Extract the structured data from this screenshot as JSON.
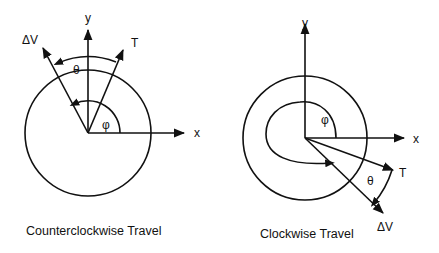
{
  "diagrams": [
    {
      "id": "counterclockwise",
      "caption": "Counterclockwise Travel",
      "axes": {
        "x_label": "x",
        "y_label": "y"
      },
      "vectors": [
        {
          "label": "ΔV",
          "name": "delta-v"
        },
        {
          "label": "T",
          "name": "thrust"
        }
      ],
      "angles": [
        {
          "label": "θ",
          "name": "theta"
        },
        {
          "label": "φ",
          "name": "phi"
        }
      ]
    },
    {
      "id": "clockwise",
      "caption": "Clockwise Travel",
      "axes": {
        "x_label": "x",
        "y_label": "y"
      },
      "vectors": [
        {
          "label": "T",
          "name": "thrust"
        },
        {
          "label": "ΔV",
          "name": "delta-v"
        }
      ],
      "angles": [
        {
          "label": "φ",
          "name": "phi"
        },
        {
          "label": "θ",
          "name": "theta"
        }
      ]
    }
  ]
}
